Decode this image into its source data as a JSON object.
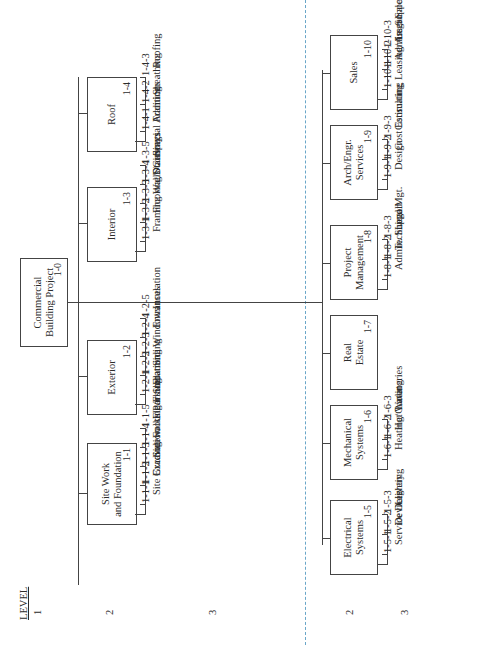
{
  "level_header": {
    "title": "LEVEL",
    "levels": [
      "1",
      "2",
      "3",
      "2",
      "3"
    ]
  },
  "root": {
    "title": "Commercial\nBuilding Project",
    "code": "1-0"
  },
  "upper_branches": [
    {
      "title": "Site Work\nand Foundation",
      "code": "1-1",
      "children": [
        {
          "code": "1-1-1",
          "name": "Site Grading"
        },
        {
          "code": "1-1-2",
          "name": "Excavation"
        },
        {
          "code": "1-1-3",
          "name": "Sidewalks/Parking"
        },
        {
          "code": "1-1-4",
          "name": "Footing/Foundation"
        },
        {
          "code": "1-1-5",
          "name": "Floor Slab"
        }
      ]
    },
    {
      "title": "Exterior",
      "code": "1-2",
      "children": [
        {
          "code": "1-2-1",
          "name": "Framing"
        },
        {
          "code": "1-2-2",
          "name": "Siding"
        },
        {
          "code": "1-2-3",
          "name": "Windows"
        },
        {
          "code": "1-2-4",
          "name": "Entrances"
        },
        {
          "code": "1-2-5",
          "name": "Insulation"
        }
      ]
    },
    {
      "title": "Interior",
      "code": "1-3",
      "children": [
        {
          "code": "1-3-1",
          "name": "Framing"
        },
        {
          "code": "1-3-2",
          "name": "Flooring/Stairways"
        },
        {
          "code": "1-3-3",
          "name": "Walls/Ceilings"
        },
        {
          "code": "1-3-4",
          "name": "Doors"
        },
        {
          "code": "1-3-5",
          "name": "Special Additions"
        }
      ]
    },
    {
      "title": "Roof",
      "code": "1-4",
      "children": [
        {
          "code": "1-4-1",
          "name": "Framing"
        },
        {
          "code": "1-4-2",
          "name": "Sheathing"
        },
        {
          "code": "1-4-3",
          "name": "Roofing"
        }
      ]
    }
  ],
  "lower_branches": [
    {
      "title": "Electrical\nSystems",
      "code": "1-5",
      "children": [
        {
          "code": "1-5-1",
          "name": "Service Delivery"
        },
        {
          "code": "1-5-2",
          "name": "Devices"
        },
        {
          "code": "1-5-3",
          "name": "Lighting"
        }
      ]
    },
    {
      "title": "Mechanical\nSystems",
      "code": "1-6",
      "children": [
        {
          "code": "1-6-1",
          "name": "Heating/Cooling"
        },
        {
          "code": "1-6-2",
          "name": "Hot Water"
        },
        {
          "code": "1-6-3",
          "name": "Lavatories"
        }
      ]
    },
    {
      "title": "Real\nEstate",
      "code": "1-7",
      "children": []
    },
    {
      "title": "Project\nManagement",
      "code": "1-8",
      "children": [
        {
          "code": "1-8-1",
          "name": "Admin. Support"
        },
        {
          "code": "1-8-2",
          "name": "Technical Mgt."
        },
        {
          "code": "1-8-3",
          "name": "Legal"
        }
      ]
    },
    {
      "title": "Arch/Engr.\nServices",
      "code": "1-9",
      "children": [
        {
          "code": "1-9-1",
          "name": "Design"
        },
        {
          "code": "1-9-2",
          "name": "Cost Estimating"
        },
        {
          "code": "1-9-3",
          "name": "Consulting"
        }
      ]
    },
    {
      "title": "Sales",
      "code": "1-10",
      "children": [
        {
          "code": "1-10-1",
          "name": "Leasing/Asset Sales"
        },
        {
          "code": "1-10-2",
          "name": "Admin. Support"
        },
        {
          "code": "1-10-3",
          "name": "Legal"
        }
      ]
    }
  ],
  "colors": {
    "lines": "#444444",
    "divider": "#6aa6c8"
  }
}
